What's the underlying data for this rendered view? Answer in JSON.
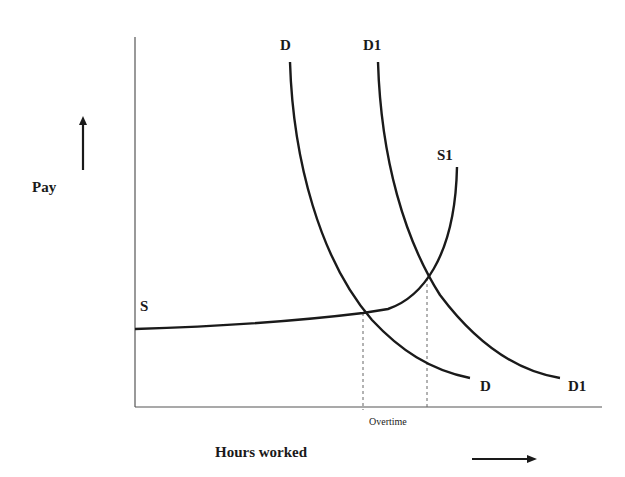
{
  "diagram": {
    "y_axis_label": "Pay",
    "x_axis_label": "Hours worked",
    "x_marker_label": "Overtime",
    "curves": {
      "demand": {
        "label_top": "D",
        "label_bottom": "D"
      },
      "demand_shifted": {
        "label_top": "D1",
        "label_bottom": "D1"
      },
      "supply": {
        "label": "S"
      },
      "supply_overtime": {
        "label": "S1"
      }
    },
    "colors": {
      "line": "#1a1a1a",
      "axis": "#555555",
      "dashed": "#666666",
      "background": "#ffffff"
    }
  }
}
